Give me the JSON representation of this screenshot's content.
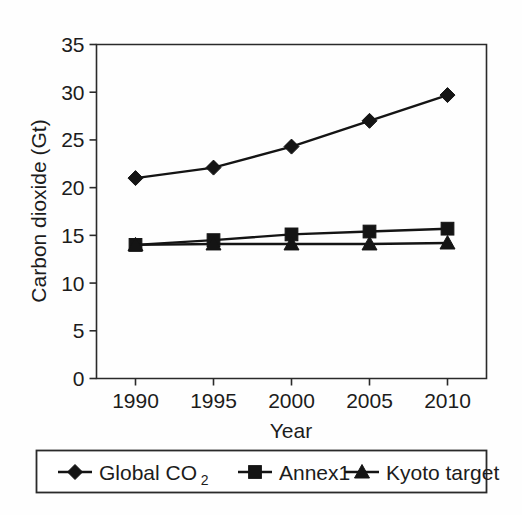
{
  "chart_data": {
    "type": "line",
    "title": "",
    "xlabel": "Year",
    "ylabel": "Carbon dioxide (Gt)",
    "x": [
      1990,
      1995,
      2000,
      2005,
      2010
    ],
    "xtick_labels": [
      "1990",
      "1995",
      "2000",
      "2005",
      "2010"
    ],
    "ytick_labels": [
      "0",
      "5",
      "10",
      "15",
      "20",
      "25",
      "30",
      "35"
    ],
    "yticks": [
      0,
      5,
      10,
      15,
      20,
      25,
      30,
      35
    ],
    "xlim": [
      1987.5,
      2012.5
    ],
    "ylim": [
      0,
      35
    ],
    "grid": false,
    "legend_position": "below",
    "series": [
      {
        "name": "Global CO2",
        "label": "Global CO",
        "label_sub": "2",
        "marker": "diamond",
        "color": "#141414",
        "values": [
          21.0,
          22.1,
          24.3,
          27.0,
          29.7
        ]
      },
      {
        "name": "Annex1",
        "label": "Annex1",
        "label_sub": "",
        "marker": "square",
        "color": "#141414",
        "values": [
          14.0,
          14.5,
          15.1,
          15.4,
          15.7
        ]
      },
      {
        "name": "Kyoto target",
        "label": "Kyoto target",
        "label_sub": "",
        "marker": "triangle",
        "color": "#141414",
        "values": [
          14.0,
          14.1,
          14.1,
          14.1,
          14.2
        ]
      }
    ]
  },
  "figure": {
    "background_color": "#fefefe",
    "axis_color": "#2a2a2a",
    "text_color": "#1c1c1c"
  }
}
